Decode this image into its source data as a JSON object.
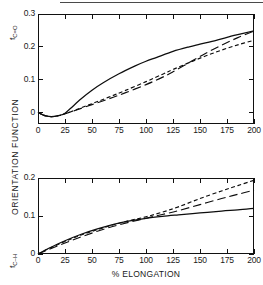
{
  "figure": {
    "axis_title_x": "% ELONGATION",
    "axis_title_y": "ORIENTATION FUNCTION"
  },
  "panels": {
    "top": {
      "tag": "f",
      "tag_sub": "C=O",
      "y_ticks": [
        "0",
        "0.1",
        "0.2",
        "0.3"
      ],
      "x_ticks": [
        "0",
        "25",
        "50",
        "75",
        "100",
        "125",
        "150",
        "175",
        "200"
      ]
    },
    "bottom": {
      "tag": "f",
      "tag_sub": "C–H",
      "y_ticks": [
        "0",
        "0.1",
        "0.2"
      ],
      "x_ticks": [
        "0",
        "25",
        "50",
        "75",
        "100",
        "125",
        "150",
        "175",
        "200"
      ]
    }
  },
  "chart_data": [
    {
      "type": "line",
      "title": "f_C=O orientation function vs % elongation",
      "xlabel": "% ELONGATION",
      "ylabel": "ORIENTATION FUNCTION",
      "xlim": [
        0,
        200
      ],
      "ylim": [
        -0.03,
        0.3
      ],
      "xticks": [
        0,
        25,
        50,
        75,
        100,
        125,
        150,
        175,
        200
      ],
      "yticks": [
        0,
        0.1,
        0.2,
        0.3
      ],
      "grid": false,
      "legend": "none",
      "series": [
        {
          "name": "solid",
          "style": "solid",
          "x": [
            0,
            5,
            10,
            15,
            20,
            25,
            30,
            40,
            50,
            60,
            75,
            90,
            100,
            110,
            125,
            140,
            150,
            165,
            175,
            190,
            200
          ],
          "y": [
            0.0,
            -0.008,
            -0.012,
            -0.012,
            -0.009,
            -0.002,
            0.012,
            0.042,
            0.068,
            0.09,
            0.118,
            0.142,
            0.156,
            0.168,
            0.186,
            0.2,
            0.208,
            0.22,
            0.229,
            0.241,
            0.249
          ]
        },
        {
          "name": "short-dash",
          "style": "dashed",
          "x": [
            0,
            5,
            10,
            15,
            20,
            25,
            35,
            50,
            65,
            80,
            100,
            115,
            125,
            140,
            155,
            170,
            185,
            200
          ],
          "y": [
            0.0,
            -0.008,
            -0.012,
            -0.012,
            -0.009,
            -0.004,
            0.008,
            0.027,
            0.046,
            0.066,
            0.094,
            0.116,
            0.131,
            0.152,
            0.172,
            0.19,
            0.206,
            0.22
          ]
        },
        {
          "name": "long-dash",
          "style": "long-dash",
          "x": [
            0,
            5,
            10,
            15,
            20,
            25,
            35,
            50,
            65,
            80,
            100,
            115,
            125,
            140,
            155,
            170,
            185,
            200
          ],
          "y": [
            0.0,
            -0.008,
            -0.012,
            -0.012,
            -0.009,
            -0.004,
            0.007,
            0.024,
            0.041,
            0.059,
            0.085,
            0.107,
            0.124,
            0.152,
            0.18,
            0.205,
            0.228,
            0.248
          ]
        }
      ]
    },
    {
      "type": "line",
      "title": "f_C-H orientation function vs % elongation",
      "xlabel": "% ELONGATION",
      "ylabel": "ORIENTATION FUNCTION",
      "xlim": [
        0,
        200
      ],
      "ylim": [
        0,
        0.2
      ],
      "xticks": [
        0,
        25,
        50,
        75,
        100,
        125,
        150,
        175,
        200
      ],
      "yticks": [
        0,
        0.1,
        0.2
      ],
      "grid": false,
      "legend": "none",
      "series": [
        {
          "name": "solid",
          "style": "solid",
          "x": [
            0,
            10,
            25,
            40,
            55,
            70,
            85,
            100,
            115,
            130,
            150,
            170,
            185,
            200
          ],
          "y": [
            0.0,
            0.015,
            0.035,
            0.052,
            0.066,
            0.078,
            0.087,
            0.094,
            0.099,
            0.103,
            0.108,
            0.113,
            0.116,
            0.12
          ]
        },
        {
          "name": "short-dash",
          "style": "dashed",
          "x": [
            0,
            10,
            25,
            40,
            55,
            70,
            85,
            100,
            115,
            130,
            150,
            170,
            185,
            200
          ],
          "y": [
            0.0,
            0.014,
            0.033,
            0.05,
            0.064,
            0.077,
            0.088,
            0.098,
            0.11,
            0.124,
            0.146,
            0.166,
            0.18,
            0.194
          ]
        },
        {
          "name": "long-dash",
          "style": "long-dash",
          "x": [
            0,
            10,
            25,
            40,
            55,
            70,
            85,
            100,
            115,
            130,
            150,
            170,
            185,
            200
          ],
          "y": [
            0.0,
            0.012,
            0.029,
            0.045,
            0.06,
            0.073,
            0.084,
            0.094,
            0.104,
            0.114,
            0.13,
            0.146,
            0.157,
            0.168
          ]
        }
      ]
    }
  ]
}
